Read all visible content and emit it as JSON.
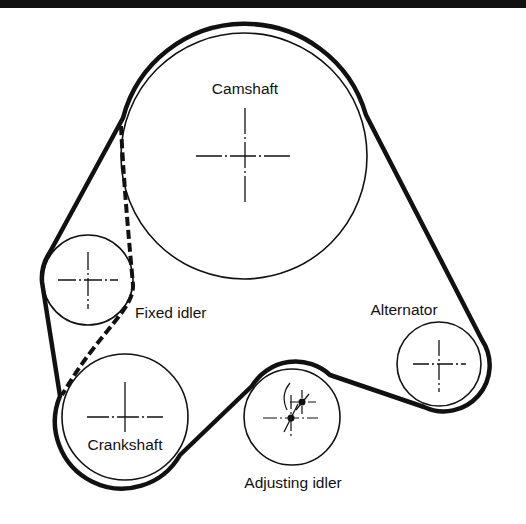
{
  "diagram": {
    "type": "belt-routing",
    "colors": {
      "ink": "#111111",
      "background": "#ffffff"
    },
    "pulleys": [
      {
        "id": "camshaft",
        "label": "Camshaft",
        "cx": 244,
        "cy": 156,
        "r": 123,
        "label_x": 245,
        "label_y": 94
      },
      {
        "id": "fixed_idler",
        "label": "Fixed idler",
        "cx": 88,
        "cy": 280,
        "r": 45,
        "label_x": 135,
        "label_y": 318
      },
      {
        "id": "crankshaft",
        "label": "Crankshaft",
        "cx": 125,
        "cy": 417,
        "r": 63,
        "label_x": 125,
        "label_y": 450
      },
      {
        "id": "adjusting_idler",
        "label": "Adjusting idler",
        "cx": 292,
        "cy": 417,
        "r": 48,
        "label_x": 293,
        "label_y": 488
      },
      {
        "id": "alternator",
        "label": "Alternator",
        "cx": 439,
        "cy": 364,
        "r": 42,
        "label_x": 404,
        "label_y": 315
      }
    ],
    "belt": {
      "style": "solid",
      "path": "M 123 118 A 126 126 0 0 1 366 115 L 482 340 A 46 46 0 0 1 424 407 L 330 375 A 51 51 0 0 0 252 386 L 180 455 A 67 67 0 0 1 60 396 L 42 282 A 47 47 0 0 1 50 252 Z"
    },
    "alt_belt": {
      "style": "dashed",
      "path": "M 121 126 C 124 190 130 250 133 285 C 134 310 100 330 62 395"
    }
  }
}
